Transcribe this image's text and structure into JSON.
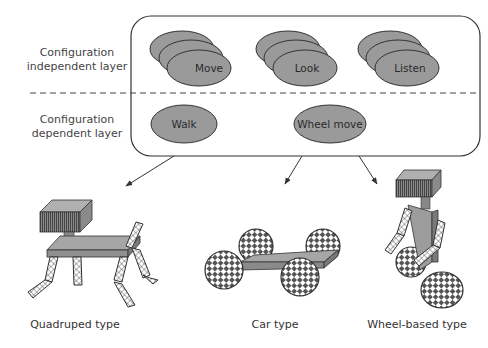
{
  "diagram": {
    "layers": {
      "independent": {
        "line1": "Configuration",
        "line2": "independent layer"
      },
      "dependent": {
        "line1": "Configuration",
        "line2": "dependent layer"
      }
    },
    "independent_nodes": [
      {
        "label": "Move"
      },
      {
        "label": "Look"
      },
      {
        "label": "Listen"
      }
    ],
    "dependent_nodes": [
      {
        "label": "Walk"
      },
      {
        "label": "Wheel move"
      }
    ],
    "robots": [
      {
        "label": "Quadruped type"
      },
      {
        "label": "Car type"
      },
      {
        "label": "Wheel-based type"
      }
    ],
    "colors": {
      "node_fill": "#9a9a9a",
      "stroke": "#333333",
      "body_fill": "#a0a0a0",
      "checker_dark": "#555555"
    }
  }
}
